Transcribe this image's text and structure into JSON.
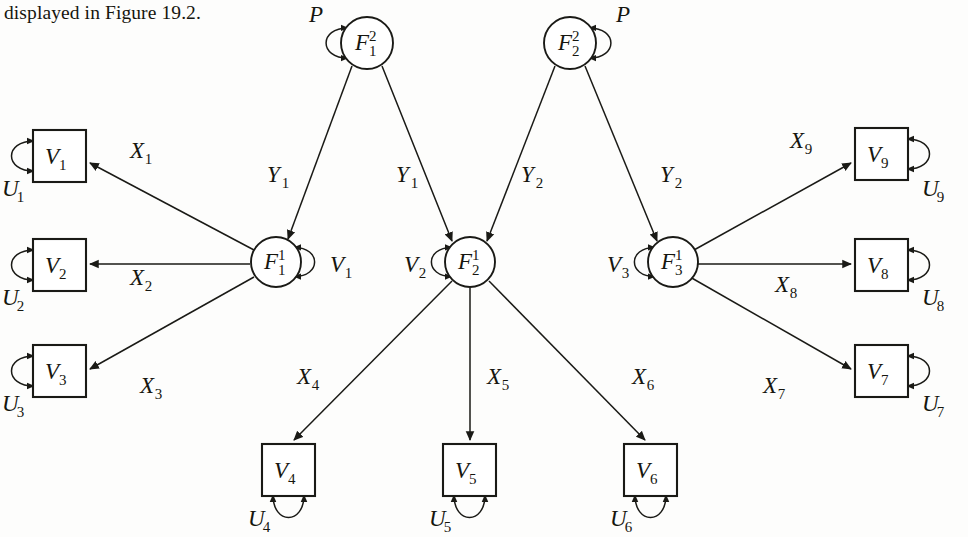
{
  "caption": {
    "text": "displayed in Figure 19.2."
  },
  "figure": {
    "second_order_factors": [
      {
        "id": "F1_2",
        "base": "F",
        "sub": "1",
        "sup": "2",
        "cx": 367,
        "cy": 43,
        "r": 26,
        "loop_side": "left",
        "loop_label": {
          "base": "P",
          "sub": "",
          "lx": 309,
          "ly": 22
        }
      },
      {
        "id": "F2_2",
        "base": "F",
        "sub": "2",
        "sup": "2",
        "cx": 570,
        "cy": 43,
        "r": 26,
        "loop_side": "right",
        "loop_label": {
          "base": "P",
          "sub": "",
          "lx": 616,
          "ly": 22
        }
      }
    ],
    "first_order_factors": [
      {
        "id": "F1_1",
        "base": "F",
        "sub": "1",
        "sup": "1",
        "cx": 276,
        "cy": 262,
        "r": 25,
        "loop_side": "right",
        "loop_label": {
          "base": "V",
          "sub": "1",
          "lx": 330,
          "ly": 272
        }
      },
      {
        "id": "F2_1",
        "base": "F",
        "sub": "2",
        "sup": "1",
        "cx": 470,
        "cy": 262,
        "r": 25,
        "loop_side": "left",
        "loop_label": {
          "base": "V",
          "sub": "2",
          "lx": 404,
          "ly": 272
        }
      },
      {
        "id": "F3_1",
        "base": "F",
        "sub": "3",
        "sup": "1",
        "cx": 673,
        "cy": 262,
        "r": 25,
        "loop_side": "left",
        "loop_label": {
          "base": "V",
          "sub": "3",
          "lx": 607,
          "ly": 272
        }
      }
    ],
    "observed_variables": [
      {
        "id": "V1",
        "base": "V",
        "sub": "1",
        "x": 33,
        "y": 130,
        "w": 53,
        "h": 52,
        "loop_side": "left",
        "loop_label": {
          "base": "U",
          "sub": "1",
          "lx": 2,
          "ly": 196
        }
      },
      {
        "id": "V2",
        "base": "V",
        "sub": "2",
        "x": 33,
        "y": 239,
        "w": 53,
        "h": 52,
        "loop_side": "left",
        "loop_label": {
          "base": "U",
          "sub": "2",
          "lx": 2,
          "ly": 305
        }
      },
      {
        "id": "V3",
        "base": "V",
        "sub": "3",
        "x": 33,
        "y": 345,
        "w": 53,
        "h": 52,
        "loop_side": "left",
        "loop_label": {
          "base": "U",
          "sub": "3",
          "lx": 2,
          "ly": 411
        }
      },
      {
        "id": "V4",
        "base": "V",
        "sub": "4",
        "x": 262,
        "y": 444,
        "w": 53,
        "h": 52,
        "loop_side": "bottom",
        "loop_label": {
          "base": "U",
          "sub": "4",
          "lx": 248,
          "ly": 526
        }
      },
      {
        "id": "V5",
        "base": "V",
        "sub": "5",
        "x": 443,
        "y": 444,
        "w": 53,
        "h": 52,
        "loop_side": "bottom",
        "loop_label": {
          "base": "U",
          "sub": "5",
          "lx": 429,
          "ly": 526
        }
      },
      {
        "id": "V6",
        "base": "V",
        "sub": "6",
        "x": 624,
        "y": 444,
        "w": 53,
        "h": 52,
        "loop_side": "bottom",
        "loop_label": {
          "base": "U",
          "sub": "6",
          "lx": 610,
          "ly": 526
        }
      },
      {
        "id": "V7",
        "base": "V",
        "sub": "7",
        "x": 855,
        "y": 345,
        "w": 53,
        "h": 52,
        "loop_side": "right",
        "loop_label": {
          "base": "U",
          "sub": "7",
          "lx": 922,
          "ly": 411
        }
      },
      {
        "id": "V8",
        "base": "V",
        "sub": "8",
        "x": 855,
        "y": 239,
        "w": 53,
        "h": 52,
        "loop_side": "right",
        "loop_label": {
          "base": "U",
          "sub": "8",
          "lx": 922,
          "ly": 305
        }
      },
      {
        "id": "V9",
        "base": "V",
        "sub": "9",
        "x": 855,
        "y": 128,
        "w": 53,
        "h": 52,
        "loop_side": "right",
        "loop_label": {
          "base": "U",
          "sub": "9",
          "lx": 922,
          "ly": 196
        }
      }
    ],
    "edges": [
      {
        "id": "F1_2-to-F1_1",
        "from": "F1_2",
        "to": "F1_1",
        "x1": 352,
        "y1": 66,
        "x2": 288,
        "y2": 239,
        "label": {
          "base": "Y",
          "sub": "1",
          "lx": 267,
          "ly": 182
        }
      },
      {
        "id": "F1_2-to-F2_1",
        "from": "F1_2",
        "to": "F2_1",
        "x1": 382,
        "y1": 66,
        "x2": 452,
        "y2": 241,
        "label": {
          "base": "Y",
          "sub": "1",
          "lx": 396,
          "ly": 182
        }
      },
      {
        "id": "F2_2-to-F2_1",
        "from": "F2_2",
        "to": "F2_1",
        "x1": 555,
        "y1": 66,
        "x2": 487,
        "y2": 241,
        "label": {
          "base": "Y",
          "sub": "2",
          "lx": 521,
          "ly": 182
        }
      },
      {
        "id": "F2_2-to-F3_1",
        "from": "F2_2",
        "to": "F3_1",
        "x1": 585,
        "y1": 66,
        "x2": 657,
        "y2": 241,
        "label": {
          "base": "Y",
          "sub": "2",
          "lx": 660,
          "ly": 182
        }
      },
      {
        "id": "F1_1-to-V1",
        "from": "F1_1",
        "to": "V1",
        "x1": 254,
        "y1": 250,
        "x2": 90,
        "y2": 163,
        "label": {
          "base": "X",
          "sub": "1",
          "lx": 130,
          "ly": 158
        }
      },
      {
        "id": "F1_1-to-V2",
        "from": "F1_1",
        "to": "V2",
        "x1": 250,
        "y1": 264,
        "x2": 90,
        "y2": 264,
        "label": {
          "base": "X",
          "sub": "2",
          "lx": 130,
          "ly": 285
        }
      },
      {
        "id": "F1_1-to-V3",
        "from": "F1_1",
        "to": "V3",
        "x1": 254,
        "y1": 277,
        "x2": 90,
        "y2": 369,
        "label": {
          "base": "X",
          "sub": "3",
          "lx": 140,
          "ly": 393
        }
      },
      {
        "id": "F2_1-to-V4",
        "from": "F2_1",
        "to": "V4",
        "x1": 452,
        "y1": 281,
        "x2": 294,
        "y2": 440,
        "label": {
          "base": "X",
          "sub": "4",
          "lx": 297,
          "ly": 384
        }
      },
      {
        "id": "F2_1-to-V5",
        "from": "F2_1",
        "to": "V5",
        "x1": 470,
        "y1": 288,
        "x2": 470,
        "y2": 440,
        "label": {
          "base": "X",
          "sub": "5",
          "lx": 487,
          "ly": 384
        }
      },
      {
        "id": "F2_1-to-V6",
        "from": "F2_1",
        "to": "V6",
        "x1": 489,
        "y1": 281,
        "x2": 645,
        "y2": 440,
        "label": {
          "base": "X",
          "sub": "6",
          "lx": 632,
          "ly": 384
        }
      },
      {
        "id": "F3_1-to-V7",
        "from": "F3_1",
        "to": "V7",
        "x1": 690,
        "y1": 277,
        "x2": 851,
        "y2": 369,
        "label": {
          "base": "X",
          "sub": "7",
          "lx": 763,
          "ly": 393
        }
      },
      {
        "id": "F3_1-to-V8",
        "from": "F3_1",
        "to": "V8",
        "x1": 698,
        "y1": 264,
        "x2": 851,
        "y2": 264,
        "label": {
          "base": "X",
          "sub": "8",
          "lx": 775,
          "ly": 292
        }
      },
      {
        "id": "F3_1-to-V9",
        "from": "F3_1",
        "to": "V9",
        "x1": 694,
        "y1": 250,
        "x2": 851,
        "y2": 163,
        "label": {
          "base": "X",
          "sub": "9",
          "lx": 790,
          "ly": 148
        }
      }
    ]
  }
}
